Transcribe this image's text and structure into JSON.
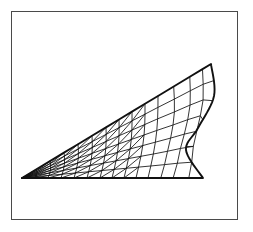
{
  "figure": {
    "background_color": "#ffffff",
    "line_color": "#111111",
    "frame_color": "#4a4a4a",
    "frame": {
      "x": 11,
      "y": 11,
      "width": 227,
      "height": 209,
      "stroke_width": 1.4
    }
  },
  "chart_data": {
    "type": "mesh",
    "title": "",
    "xlabel": "",
    "ylabel": "",
    "grid": false,
    "legend": null,
    "domain_description": "wedge / nozzle cross-section: sharp tip at lower left, straight upper boundary rising to the right, concave S-curved right boundary, horizontal lower boundary",
    "axis_ranges": {
      "x": [
        22,
        212
      ],
      "y": [
        64,
        178
      ]
    },
    "mesh": {
      "columns": 14,
      "rows": 7,
      "element_types": [
        "quadrilateral",
        "triangle"
      ],
      "diagonal_region_columns": [
        0,
        1,
        2,
        3,
        4,
        5,
        6,
        7,
        8
      ],
      "quad_region_columns": [
        9,
        10,
        11,
        12,
        13
      ],
      "bottom_edge": {
        "y": 178,
        "x_start": 22,
        "x_end": 203
      },
      "tip_vertex": [
        22,
        178
      ],
      "apex_vertex": [
        211,
        64
      ],
      "bottom_right_vertex": [
        203,
        178
      ],
      "upper_boundary": "straight line from tip [22,178] to apex [211,64]",
      "right_boundary_control_points": [
        [
          211,
          64
        ],
        [
          214,
          96
        ],
        [
          198,
          128
        ],
        [
          186,
          150
        ],
        [
          203,
          178
        ]
      ],
      "column_bottom_x": [
        22,
        35,
        48,
        61,
        74,
        87,
        100,
        112,
        124,
        136,
        148,
        160,
        172,
        188,
        203
      ],
      "column_top_x": [
        22,
        36,
        50,
        64,
        78,
        92,
        106,
        119,
        132,
        145,
        158,
        173,
        189,
        202,
        211
      ]
    }
  }
}
